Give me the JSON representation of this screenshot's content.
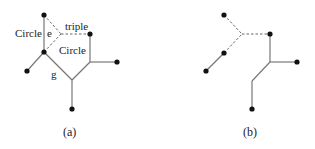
{
  "panels": [
    {
      "caption": "(a)",
      "labels": {
        "circle_left": "Circle",
        "edge_e": "e",
        "triple": "triple",
        "circle_center": "Circle",
        "edge_g": "g"
      }
    },
    {
      "caption": "(b)"
    }
  ],
  "colors": {
    "solid_edge": "#777777",
    "dashed_edge": "#666666",
    "node": "#111111"
  }
}
